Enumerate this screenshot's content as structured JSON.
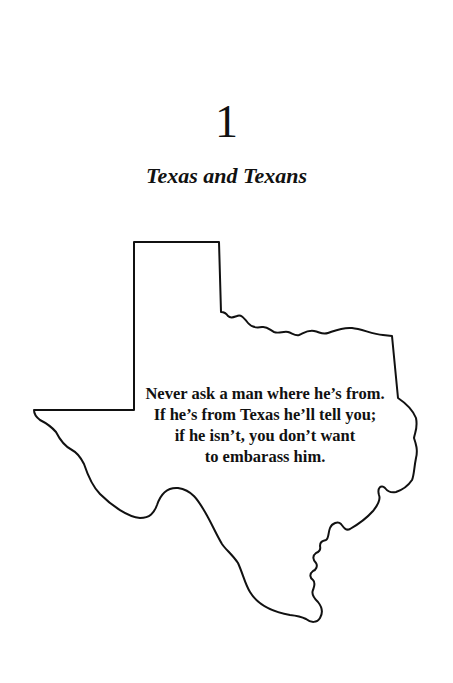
{
  "chapter": {
    "number": "1",
    "title": "Texas and Texans"
  },
  "illustration": {
    "shape": "texas-state-outline",
    "stroke_color": "#111111",
    "fill_color": "#ffffff"
  },
  "quote": {
    "lines": [
      "Never ask a man where he’s from.",
      "If he’s from Texas he’ll tell you;",
      "if he isn’t, you don’t want",
      "to embarass him."
    ]
  }
}
